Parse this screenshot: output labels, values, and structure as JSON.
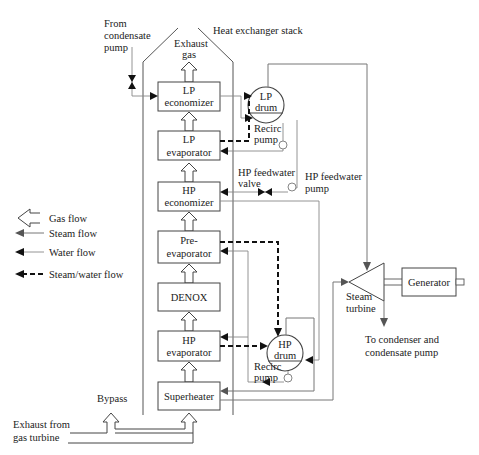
{
  "title": "Heat exchanger stack",
  "labels": {
    "from_condensate": [
      "From",
      "condensate",
      "pump"
    ],
    "exhaust_gas": [
      "Exhaust",
      "gas"
    ],
    "heat_exchanger_stack": "Heat exchanger stack",
    "lp_drum": [
      "LP",
      "drum"
    ],
    "lp_recirc_pump": [
      "Recirc",
      "pump"
    ],
    "hp_feedwater_valve": [
      "HP feedwater",
      "valve"
    ],
    "hp_feedwater_pump": [
      "HP feedwater",
      "pump"
    ],
    "hp_drum": [
      "HP",
      "drum"
    ],
    "hp_recirc_pump": [
      "Recirc",
      "pump"
    ],
    "steam_turbine": [
      "Steam",
      "turbine"
    ],
    "generator": "Generator",
    "to_condenser": [
      "To condenser and",
      "condensate pump"
    ],
    "bypass": "Bypass",
    "exhaust_from_gt": [
      "Exhaust from",
      "gas turbine"
    ]
  },
  "stack_components": [
    {
      "id": "lp-economizer",
      "lines": [
        "LP",
        "economizer"
      ]
    },
    {
      "id": "lp-evaporator",
      "lines": [
        "LP",
        "evaporator"
      ]
    },
    {
      "id": "hp-economizer",
      "lines": [
        "HP",
        "economizer"
      ]
    },
    {
      "id": "pre-evaporator",
      "lines": [
        "Pre-",
        "evaporator"
      ]
    },
    {
      "id": "denox",
      "lines": [
        "DENOX"
      ]
    },
    {
      "id": "hp-evaporator",
      "lines": [
        "HP",
        "evaporator"
      ]
    },
    {
      "id": "superheater",
      "lines": [
        "Superheater"
      ]
    }
  ],
  "legend": [
    {
      "type": "gas",
      "label": "Gas flow"
    },
    {
      "type": "steam",
      "label": "Steam flow"
    },
    {
      "type": "water",
      "label": "Water flow"
    },
    {
      "type": "steam-water",
      "label": "Steam/water flow"
    }
  ],
  "colors": {
    "line_black": "#111111",
    "line_grey": "#777777",
    "box_stroke": "#444444",
    "background": "#ffffff"
  }
}
